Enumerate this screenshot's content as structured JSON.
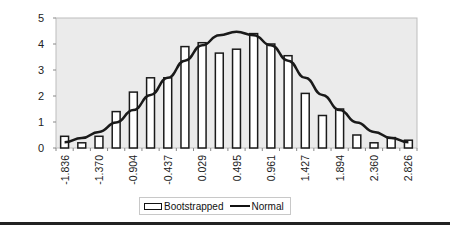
{
  "chart_data": {
    "type": "bar",
    "title": "",
    "xlabel": "",
    "ylabel": "",
    "ylim": [
      0,
      5
    ],
    "yticks": [
      0,
      1,
      2,
      3,
      4,
      5
    ],
    "grid": false,
    "plot_background": "#ebebeb",
    "legend_position": "bottom",
    "x": [
      -1.836,
      -1.603,
      -1.37,
      -1.137,
      -0.904,
      -0.67,
      -0.437,
      -0.204,
      0.029,
      0.262,
      0.495,
      0.728,
      0.961,
      1.194,
      1.427,
      1.661,
      1.894,
      2.127,
      2.36,
      2.593,
      2.826
    ],
    "tick_labels": [
      "-1.836",
      "-1.370",
      "-0.904",
      "-0.437",
      "0.029",
      "0.495",
      "0.961",
      "1.427",
      "1.894",
      "2.360",
      "2.826"
    ],
    "series": [
      {
        "name": "Bootstrapped",
        "type": "bar",
        "values": [
          0.45,
          0.2,
          0.45,
          1.4,
          2.15,
          2.7,
          2.7,
          3.9,
          4.05,
          3.65,
          3.8,
          4.4,
          4.0,
          3.55,
          2.1,
          1.25,
          1.5,
          0.5,
          0.2,
          0.4,
          0.3
        ]
      },
      {
        "name": "Normal",
        "type": "line",
        "values": [
          0.22,
          0.38,
          0.62,
          0.98,
          1.46,
          2.04,
          2.7,
          3.36,
          3.95,
          4.34,
          4.47,
          4.34,
          3.95,
          3.36,
          2.7,
          2.04,
          1.46,
          0.98,
          0.62,
          0.38,
          0.22
        ]
      }
    ]
  },
  "legend": {
    "items": [
      {
        "label": "Bootstrapped",
        "icon": "bar-swatch-icon"
      },
      {
        "label": "Normal",
        "icon": "line-swatch-icon"
      }
    ]
  }
}
